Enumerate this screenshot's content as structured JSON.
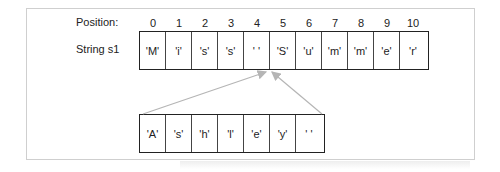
{
  "labels": {
    "position": "Position:",
    "string": "String s1"
  },
  "positions": [
    "0",
    "1",
    "2",
    "3",
    "4",
    "5",
    "6",
    "7",
    "8",
    "9",
    "10"
  ],
  "s1_cells": [
    "'M'",
    "'i'",
    "'s'",
    "'s'",
    "' '",
    "'S'",
    "'u'",
    "'m'",
    "'m'",
    "'e'",
    "'r'"
  ],
  "insert_cells": [
    "'A'",
    "'s'",
    "'h'",
    "'l'",
    "'e'",
    "'y'",
    "' '"
  ],
  "colors": {
    "arrow": "#b5b5b5",
    "border": "#222222",
    "frame": "#cfcfcf"
  }
}
